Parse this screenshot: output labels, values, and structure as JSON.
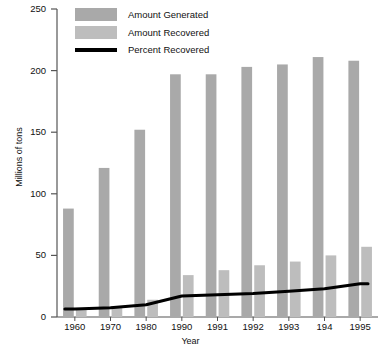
{
  "chart_data": {
    "type": "bar",
    "title": "",
    "xlabel": "Year",
    "ylabel": "Millions of tons",
    "ylim": [
      0,
      250
    ],
    "yticks": [
      0,
      50,
      100,
      150,
      200,
      250
    ],
    "grid": false,
    "legend_position": "top-left",
    "categories": [
      "1960",
      "1970",
      "1980",
      "1990",
      "1991",
      "1992",
      "1993",
      "194",
      "1995"
    ],
    "series": [
      {
        "name": "Amount Generated",
        "type": "bar",
        "color": "#a9a9a9",
        "values": [
          88,
          121,
          152,
          197,
          197,
          203,
          205,
          211,
          208
        ]
      },
      {
        "name": "Amount Recovered",
        "type": "bar",
        "color": "#bdbdbd",
        "values": [
          6,
          8,
          14,
          34,
          38,
          42,
          45,
          50,
          57
        ]
      },
      {
        "name": "Percent Recovered",
        "type": "line",
        "color": "#000000",
        "values": [
          6.5,
          7.5,
          10,
          17,
          18,
          19,
          21,
          23,
          27
        ]
      }
    ]
  },
  "legend": {
    "items": [
      {
        "label": "Amount Generated",
        "marker": "square",
        "color": "#a9a9a9"
      },
      {
        "label": "Amount Recovered",
        "marker": "square",
        "color": "#bdbdbd"
      },
      {
        "label": "Percent Recovered",
        "marker": "line",
        "color": "#000000"
      }
    ]
  },
  "axes": {
    "y_title": "Millions of tons",
    "x_title": "Year",
    "y_tick_labels": [
      "250",
      "200",
      "150",
      "100",
      "50",
      "0"
    ],
    "x_tick_labels": [
      "1960",
      "1970",
      "1980",
      "1990",
      "1991",
      "1992",
      "1993",
      "194",
      "1995"
    ]
  }
}
